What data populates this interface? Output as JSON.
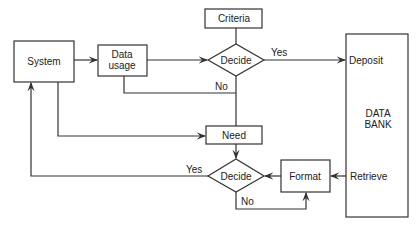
{
  "diagram": {
    "nodes": {
      "system": {
        "label": "System"
      },
      "data_usage": {
        "line1": "Data",
        "line2": "usage"
      },
      "criteria": {
        "label": "Criteria"
      },
      "decide1": {
        "label": "Decide"
      },
      "need": {
        "label": "Need"
      },
      "decide2": {
        "label": "Decide"
      },
      "format": {
        "label": "Format"
      },
      "data_bank": {
        "line1": "DATA",
        "line2": "BANK",
        "deposit": "Deposit",
        "retrieve": "Retrieve"
      }
    },
    "edges": {
      "decide1_yes": "Yes",
      "decide1_no": "No",
      "decide2_yes": "Yes",
      "decide2_no": "No"
    },
    "stroke_color": "#333333"
  }
}
